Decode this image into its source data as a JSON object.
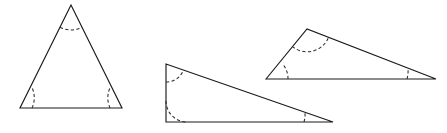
{
  "figure": {
    "canvas": {
      "width": 447,
      "height": 133,
      "background": "#ffffff"
    },
    "style": {
      "edge_color": "#1a1a1a",
      "edge_width": 1.15,
      "arc_color": "#2a2a2a",
      "arc_width": 1.05,
      "arc_dash": "3.2 2.4",
      "fill_color": "#ffffff"
    },
    "shapes": [
      {
        "name": "triangle-left",
        "label": "Left triangle (near-equilateral, apex up)",
        "points": "71,5 20,108 122,108",
        "vertices": [
          {
            "name": "apex",
            "x": 71,
            "y": 5
          },
          {
            "name": "bottom-left",
            "x": 20,
            "y": 108
          },
          {
            "name": "bottom-right",
            "x": 122,
            "y": 108
          }
        ],
        "arcs": [
          {
            "name": "angle-arc-apex",
            "d": "M 60.0 27.3 A 24 24 0 0 0 82.0 27.3"
          },
          {
            "name": "angle-arc-bottom-left",
            "d": "M 32.0 108 A 24 24 0 0 0 31.9 87.4"
          },
          {
            "name": "angle-arc-bottom-right",
            "d": "M 110.1 108 A 24 24 0 0 1 110.2 87.4"
          }
        ]
      },
      {
        "name": "triangle-middle",
        "label": "Middle triangle (right triangle, vertical left leg)",
        "points": "166,64 166,122 333,122",
        "vertices": [
          {
            "name": "top-left",
            "x": 166,
            "y": 64
          },
          {
            "name": "bottom-left-right-angle",
            "x": 166,
            "y": 122
          },
          {
            "name": "bottom-right",
            "x": 333,
            "y": 122
          }
        ],
        "arcs": [
          {
            "name": "angle-arc-top-left",
            "d": "M 166 82.0 A 18 18 0 0 0 183.3 70.3"
          },
          {
            "name": "angle-arc-bottom-left",
            "d": "M 166 101.0 A 21 21 0 0 0 187 122"
          },
          {
            "name": "angle-arc-bottom-right",
            "d": "M 304.0 122 A 29 29 0 0 0 305.0 112.0"
          }
        ]
      },
      {
        "name": "triangle-right",
        "label": "Right triangle (obtuse, apex upper-left of base)",
        "points": "266,79 307,29 436,79",
        "vertices": [
          {
            "name": "bottom-left",
            "x": 266,
            "y": 79
          },
          {
            "name": "top",
            "x": 307,
            "y": 29
          },
          {
            "name": "bottom-right",
            "x": 436,
            "y": 79
          }
        ],
        "arcs": [
          {
            "name": "angle-arc-bottom-left",
            "d": "M 288.0 79 A 22 22 0 0 0 283.8 65.5"
          },
          {
            "name": "angle-arc-top",
            "d": "M 292.3 46.4 A 23 23 0 0 0 328.5 37.3"
          },
          {
            "name": "angle-arc-bottom-right",
            "d": "M 407.0 79 A 29 29 0 0 0 408.0 68.8"
          }
        ]
      }
    ]
  }
}
